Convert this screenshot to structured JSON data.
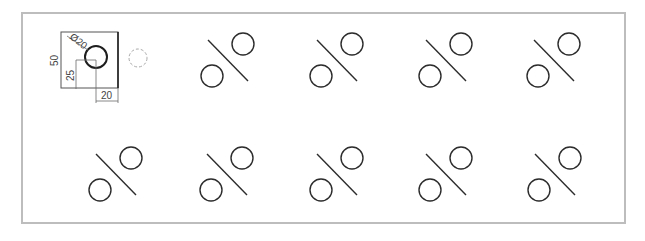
{
  "drawing": {
    "frame": {
      "x": 22,
      "y": 13,
      "width": 603,
      "height": 210
    },
    "reference_part": {
      "square": {
        "x": 61,
        "y": 32,
        "width": 57,
        "height": 56
      },
      "hole": {
        "cx": 96,
        "cy": 57,
        "r": 11
      },
      "dimensions": {
        "diameter_label": "Ø20",
        "height_label": "50",
        "hole_y_label": "25",
        "hole_x_label": "20"
      }
    },
    "ghost_circle": {
      "cx": 138,
      "cy": 58,
      "r": 9
    },
    "symbol_shape": {
      "circle_r": 11,
      "bottom_circle_offset": [
        -31,
        32
      ],
      "line_start_offset": [
        -35,
        -4
      ],
      "line_end_offset": [
        5,
        37
      ]
    },
    "symbols": [
      {
        "row": 1,
        "cx": 243,
        "cy": 44
      },
      {
        "row": 1,
        "cx": 352,
        "cy": 44
      },
      {
        "row": 1,
        "cx": 461,
        "cy": 44
      },
      {
        "row": 1,
        "cx": 569,
        "cy": 44
      },
      {
        "row": 2,
        "cx": 131,
        "cy": 158
      },
      {
        "row": 2,
        "cx": 242,
        "cy": 158
      },
      {
        "row": 2,
        "cx": 352,
        "cy": 158
      },
      {
        "row": 2,
        "cx": 461,
        "cy": 158
      },
      {
        "row": 2,
        "cx": 570,
        "cy": 158
      }
    ]
  }
}
